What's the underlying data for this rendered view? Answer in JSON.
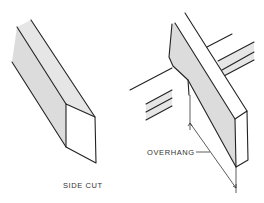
{
  "figure": {
    "panels": [
      {
        "id": "side-cut",
        "label": "SIDE CUT",
        "description": "Board end with an angled side cut, shown in isometric view"
      },
      {
        "id": "overhang",
        "label": "OVERHANG",
        "description": "Upright board crossing a horizontal member, with the overhang dimension indicated"
      }
    ],
    "colors": {
      "line": "#222222",
      "shade": "#dcdcdc",
      "background": "#ffffff"
    }
  }
}
